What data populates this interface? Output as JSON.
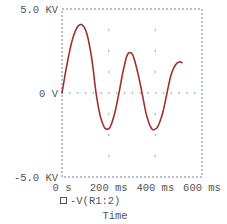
{
  "chart_data": {
    "type": "line",
    "title": "",
    "xlabel": "Time",
    "ylabel": "",
    "xlim_ms": [
      0,
      600
    ],
    "ylim_kv": [
      -5.0,
      5.0
    ],
    "x_ticks": [
      "0 s",
      "200 ms",
      "400 ms",
      "600 ms"
    ],
    "y_ticks": [
      "5.0 KV",
      "0 V",
      "-5.0 KV"
    ],
    "grid": "dotted",
    "legend": [
      {
        "marker": "square-outline",
        "label": "-V(R1:2)"
      }
    ],
    "series": [
      {
        "name": "-V(R1:2)",
        "color": "#a0302a",
        "x_ms": [
          0,
          20,
          43,
          65,
          86,
          107,
          128,
          146,
          163,
          180,
          193,
          207,
          226,
          244,
          262,
          278,
          291,
          305,
          325,
          343,
          362,
          383,
          399,
          414,
          433,
          450,
          468,
          488,
          505,
          514
        ],
        "y_kv": [
          0,
          1.6,
          3.1,
          3.9,
          4.05,
          3.5,
          2.0,
          0,
          -1.3,
          -2.0,
          -2.15,
          -2.0,
          -1.2,
          0,
          1.3,
          2.2,
          2.4,
          2.2,
          1.2,
          0,
          -1.3,
          -2.1,
          -2.15,
          -1.9,
          -1.1,
          0,
          1.1,
          1.7,
          1.85,
          1.8
        ]
      }
    ]
  }
}
